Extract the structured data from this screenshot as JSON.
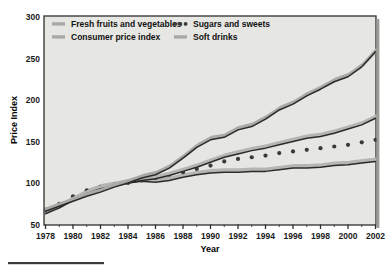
{
  "chart_data": {
    "type": "line",
    "title": "",
    "xlabel": "Year",
    "ylabel": "Price Index",
    "xlim": [
      1978,
      2002
    ],
    "ylim": [
      50,
      300
    ],
    "grid": false,
    "legend_position": "top-inside",
    "xticks": [
      1978,
      1980,
      1982,
      1984,
      1986,
      1988,
      1990,
      1992,
      1994,
      1996,
      1998,
      2000,
      2002
    ],
    "xtick_labels": [
      "1978",
      "1980",
      "1982",
      "1984",
      "1986",
      "1988",
      "1990",
      "1992",
      "1994",
      "1996",
      "1998",
      "2000",
      "2002"
    ],
    "xminor_ticks": [
      1979,
      1981,
      1983,
      1985,
      1987,
      1989,
      1991,
      1993,
      1995,
      1997,
      1999,
      2001
    ],
    "yticks": [
      50,
      100,
      150,
      200,
      250,
      300
    ],
    "ytick_labels": [
      "50",
      "100",
      "150",
      "200",
      "250",
      "300"
    ],
    "x": [
      1978,
      1979,
      1980,
      1981,
      1982,
      1983,
      1984,
      1985,
      1986,
      1987,
      1988,
      1989,
      1990,
      1991,
      1992,
      1993,
      1994,
      1995,
      1996,
      1997,
      1998,
      1999,
      2000,
      2001,
      2002
    ],
    "series": [
      {
        "name": "Fresh fruits and vegetables",
        "style": "solid-shadow",
        "color": "#2b2b2b",
        "shadow_color": "#a9a9a6",
        "values": [
          66,
          72,
          78,
          84,
          89,
          95,
          100,
          106,
          110,
          118,
          130,
          143,
          152,
          155,
          164,
          168,
          177,
          188,
          195,
          205,
          213,
          222,
          228,
          240,
          258
        ]
      },
      {
        "name": "Consumer price index",
        "style": "solid-shadow",
        "color": "#2b2b2b",
        "shadow_color": "#b5b5b2",
        "values": [
          63,
          70,
          79,
          87,
          93,
          96,
          100,
          103,
          105,
          109,
          114,
          119,
          125,
          131,
          135,
          139,
          142,
          146,
          150,
          154,
          156,
          160,
          165,
          170,
          178
        ]
      },
      {
        "name": "Sugars and sweets",
        "style": "dotted",
        "color": "#3a3a3a",
        "values": [
          68,
          75,
          84,
          91,
          95,
          98,
          100,
          103,
          106,
          110,
          113,
          117,
          121,
          126,
          129,
          131,
          133,
          136,
          138,
          140,
          142,
          144,
          146,
          149,
          152
        ]
      },
      {
        "name": "Soft drinks",
        "style": "solid-shadow",
        "color": "#2b2b2b",
        "shadow_color": "#b5b5b2",
        "values": [
          64,
          70,
          79,
          88,
          94,
          97,
          100,
          102,
          101,
          103,
          107,
          110,
          112,
          113,
          113,
          114,
          114,
          116,
          118,
          118,
          119,
          121,
          122,
          124,
          126
        ]
      }
    ]
  },
  "legend": {
    "entries": [
      {
        "label": "Fresh fruits and vegetables",
        "marker": "line-swatch"
      },
      {
        "label": "Sugars and sweets",
        "marker": "dots-swatch"
      },
      {
        "label": "Consumer price index",
        "marker": "line-swatch"
      },
      {
        "label": "Soft drinks",
        "marker": "line-swatch"
      }
    ]
  },
  "colors": {
    "plot_background": "#e6e6e3",
    "page_background": "#ffffff",
    "frame": "#3d3d3d",
    "line_dark": "#2b2b2b",
    "line_shadow": "#aeaeab",
    "text": "#131313"
  },
  "footer_rule": {
    "present": true
  }
}
